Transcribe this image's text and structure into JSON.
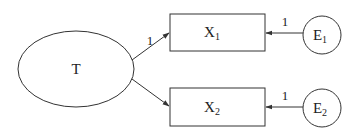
{
  "diagram": {
    "type": "path-diagram",
    "nodes": {
      "latent": {
        "label": "T",
        "shape": "ellipse"
      },
      "x1": {
        "label": "X",
        "subscript": "1",
        "shape": "rectangle"
      },
      "x2": {
        "label": "X",
        "subscript": "2",
        "shape": "rectangle"
      },
      "e1": {
        "label": "E",
        "subscript": "1",
        "shape": "circle"
      },
      "e2": {
        "label": "E",
        "subscript": "2",
        "shape": "circle"
      }
    },
    "edges": [
      {
        "from": "T",
        "to": "X1",
        "label": "1"
      },
      {
        "from": "T",
        "to": "X2",
        "label": ""
      },
      {
        "from": "E1",
        "to": "X1",
        "label": "1"
      },
      {
        "from": "E2",
        "to": "X2",
        "label": "1"
      }
    ]
  }
}
